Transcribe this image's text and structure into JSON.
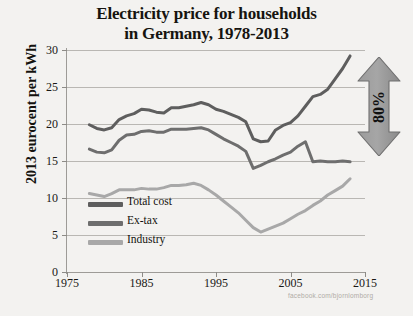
{
  "title": {
    "line1": "Electricity price for households",
    "line2": "in Germany, 1978-2013"
  },
  "axes": {
    "ylabel": "2013 eurocent per kWh",
    "yticks": [
      "0",
      "5",
      "10",
      "15",
      "20",
      "25",
      "30"
    ],
    "xticks": [
      "1975",
      "1985",
      "1995",
      "2005",
      "2015"
    ]
  },
  "legend": [
    {
      "label": "Total cost",
      "color": "#5e5e5e"
    },
    {
      "label": "Ex-tax",
      "color": "#6e6e6e"
    },
    {
      "label": "Industry",
      "color": "#a8a8a8"
    }
  ],
  "annotation": {
    "label": "80%",
    "color": "#8f8f8f"
  },
  "watermark": "facebook.com/bjornlomborg",
  "chart_data": {
    "type": "line",
    "title": "Electricity price for households in Germany, 1978-2013",
    "xlabel": "",
    "ylabel": "2013 eurocent per kWh",
    "xlim": [
      1975,
      2015
    ],
    "ylim": [
      0,
      30
    ],
    "grid": true,
    "legend_position": "inside-lower-left",
    "x": [
      1978,
      1979,
      1980,
      1981,
      1982,
      1983,
      1984,
      1985,
      1986,
      1987,
      1988,
      1989,
      1990,
      1991,
      1992,
      1993,
      1994,
      1995,
      1996,
      1997,
      1998,
      1999,
      2000,
      2001,
      2002,
      2003,
      2004,
      2005,
      2006,
      2007,
      2008,
      2009,
      2010,
      2011,
      2012,
      2013
    ],
    "series": [
      {
        "name": "Total cost",
        "color": "#5e5e5e",
        "values": [
          19.9,
          19.4,
          19.2,
          19.5,
          20.6,
          21.1,
          21.4,
          22.0,
          21.9,
          21.6,
          21.5,
          22.2,
          22.2,
          22.4,
          22.6,
          22.9,
          22.6,
          22.0,
          21.7,
          21.3,
          20.9,
          20.3,
          18.0,
          17.6,
          17.7,
          19.2,
          19.8,
          20.2,
          21.1,
          22.4,
          23.7,
          24.0,
          24.7,
          26.1,
          27.5,
          29.2
        ]
      },
      {
        "name": "Ex-tax",
        "color": "#6e6e6e",
        "values": [
          16.6,
          16.2,
          16.1,
          16.5,
          17.8,
          18.5,
          18.6,
          19.0,
          19.1,
          18.9,
          18.9,
          19.3,
          19.3,
          19.3,
          19.4,
          19.5,
          19.2,
          18.6,
          18.0,
          17.5,
          17.0,
          16.3,
          14.0,
          14.4,
          14.9,
          15.3,
          15.8,
          16.2,
          17.0,
          17.6,
          14.9,
          15.0,
          14.9,
          14.9,
          15.0,
          14.9
        ]
      },
      {
        "name": "Industry",
        "color": "#a8a8a8",
        "values": [
          10.6,
          10.4,
          10.2,
          10.6,
          11.1,
          11.1,
          11.1,
          11.3,
          11.2,
          11.2,
          11.4,
          11.7,
          11.7,
          11.8,
          12.0,
          11.7,
          11.1,
          10.4,
          9.6,
          8.8,
          8.0,
          7.0,
          6.0,
          5.4,
          5.8,
          6.2,
          6.6,
          7.2,
          7.8,
          8.3,
          9.0,
          9.6,
          10.4,
          11.0,
          11.6,
          12.6
        ]
      }
    ]
  }
}
